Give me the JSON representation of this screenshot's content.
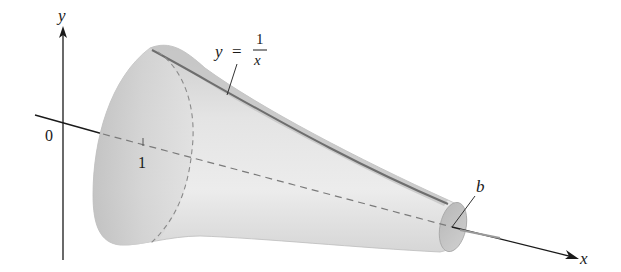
{
  "figure": {
    "axes": {
      "y_label": "y",
      "x_label": "x",
      "origin_label": "0"
    },
    "ticks": [
      {
        "label": "1"
      }
    ],
    "curve_label": {
      "lhs": "y",
      "eq": "=",
      "numerator": "1",
      "denominator": "x"
    },
    "endpoint_label": "b",
    "colors": {
      "axis": "#1a1a1a",
      "surface_light": "#e6e6e6",
      "surface_mid": "#cfcfcf",
      "surface_dark": "#a9a9a9",
      "curve": "#6e6e6e",
      "dashed": "#7a7a7a",
      "background": "#ffffff"
    }
  }
}
